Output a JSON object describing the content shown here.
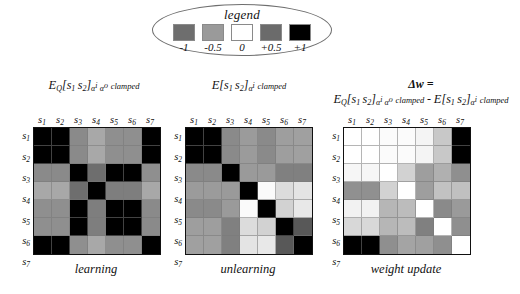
{
  "legend": {
    "title": "legend",
    "items": [
      {
        "label": "-1",
        "color": "#6e6e6e"
      },
      {
        "label": "-0.5",
        "color": "#9a9a9a"
      },
      {
        "label": "0",
        "color": "#ffffff"
      },
      {
        "label": "+0.5",
        "color": "#6b6b6b"
      },
      {
        "label": "+1",
        "color": "#000000"
      }
    ]
  },
  "axis": {
    "labels": [
      "s1",
      "s2",
      "s3",
      "s4",
      "s5",
      "s6",
      "s7"
    ],
    "symbol": "s",
    "indices": [
      "1",
      "2",
      "3",
      "4",
      "5",
      "6",
      "7"
    ]
  },
  "panels": [
    {
      "id": "learning",
      "title_html": "E_Q[s1 s2]_ai ao clamped",
      "title_parts": {
        "eps": "Ε",
        "sub_q": "Q",
        "bracket": "[s1 s2]",
        "sub_alpha_i": "αi",
        "sub_alpha_o": "αo",
        "clamped": "clamped"
      },
      "caption": "learning",
      "matrix": [
        [
          "#000000",
          "#000000",
          "#8a8a8a",
          "#a8a8a8",
          "#8f8f8f",
          "#8f8f8f",
          "#000000"
        ],
        [
          "#000000",
          "#000000",
          "#8a8a8a",
          "#a8a8a8",
          "#8f8f8f",
          "#8f8f8f",
          "#000000"
        ],
        [
          "#8a8a8a",
          "#8a8a8a",
          "#000000",
          "#6e6e6e",
          "#000000",
          "#000000",
          "#8f8f8f"
        ],
        [
          "#a8a8a8",
          "#a8a8a8",
          "#6e6e6e",
          "#000000",
          "#7e7e7e",
          "#7e7e7e",
          "#a8a8a8"
        ],
        [
          "#8f8f8f",
          "#8f8f8f",
          "#000000",
          "#7e7e7e",
          "#000000",
          "#000000",
          "#8a8a8a"
        ],
        [
          "#8f8f8f",
          "#8f8f8f",
          "#000000",
          "#7e7e7e",
          "#000000",
          "#000000",
          "#8a8a8a"
        ],
        [
          "#000000",
          "#000000",
          "#8f8f8f",
          "#a8a8a8",
          "#8f8f8f",
          "#8f8f8f",
          "#000000"
        ]
      ]
    },
    {
      "id": "unlearning",
      "title_html": "E[s1 s2]_ai clamped",
      "title_parts": {
        "eps": "Ε",
        "sub_q": "",
        "bracket": "[s1 s2]",
        "sub_alpha_i": "αi",
        "sub_alpha_o": "",
        "clamped": "clamped"
      },
      "caption": "unlearning",
      "matrix": [
        [
          "#000000",
          "#000000",
          "#8a8a8a",
          "#9b9b9b",
          "#8a8a8a",
          "#9e9e9e",
          "#a0a0a0"
        ],
        [
          "#000000",
          "#000000",
          "#8a8a8a",
          "#9b9b9b",
          "#8a8a8a",
          "#9e9e9e",
          "#a0a0a0"
        ],
        [
          "#8a8a8a",
          "#8a8a8a",
          "#000000",
          "#9a9a9a",
          "#9a9a9a",
          "#808080",
          "#808080"
        ],
        [
          "#9b9b9b",
          "#9b9b9b",
          "#9a9a9a",
          "#000000",
          "#fafafa",
          "#dcdcdc",
          "#e4e4e4"
        ],
        [
          "#8a8a8a",
          "#8a8a8a",
          "#9a9a9a",
          "#fafafa",
          "#000000",
          "#d2d2d2",
          "#e8e8e8"
        ],
        [
          "#9e9e9e",
          "#9e9e9e",
          "#808080",
          "#dcdcdc",
          "#d2d2d2",
          "#000000",
          "#585858"
        ],
        [
          "#a0a0a0",
          "#a0a0a0",
          "#808080",
          "#e4e4e4",
          "#e8e8e8",
          "#585858",
          "#000000"
        ]
      ]
    },
    {
      "id": "weight-update",
      "title_html": "dw = E_Q[s1 s2]_ai ao clamped - E[s1 s2]_ai clamped",
      "title_parts": {
        "delta_w": "Δw =",
        "eps": "Ε",
        "sub_q": "Q",
        "bracket": "[s1 s2]",
        "sub_alpha_i": "αi",
        "sub_alpha_o": "αo",
        "clamped": "clamped",
        "minus": "-"
      },
      "caption": "weight update",
      "matrix": [
        [
          "#ffffff",
          "#ffffff",
          "#fbfbfb",
          "#fbfbfb",
          "#f4f4f4",
          "#c8c8c8",
          "#000000"
        ],
        [
          "#ffffff",
          "#ffffff",
          "#fbfbfb",
          "#fbfbfb",
          "#f4f4f4",
          "#c8c8c8",
          "#000000"
        ],
        [
          "#f6f6f6",
          "#f6f6f6",
          "#ffffff",
          "#d2d2d2",
          "#9e9e9e",
          "#b0b0b0",
          "#8f8f8f"
        ],
        [
          "#909090",
          "#909090",
          "#d2d2d2",
          "#ffffff",
          "#9e9e9e",
          "#c2c2c2",
          "#c0c0c0"
        ],
        [
          "#f2f2f2",
          "#f2f2f2",
          "#b6b6b6",
          "#bcbcbc",
          "#ffffff",
          "#8a8a8a",
          "#9a9a9a"
        ],
        [
          "#d8d8d8",
          "#d8d8d8",
          "#b6b6b6",
          "#bcbcbc",
          "#808080",
          "#ffffff",
          "#8f8f8f"
        ],
        [
          "#000000",
          "#000000",
          "#8f8f8f",
          "#a4a4a4",
          "#a0a0a0",
          "#8f8f8f",
          "#ffffff"
        ]
      ]
    }
  ]
}
